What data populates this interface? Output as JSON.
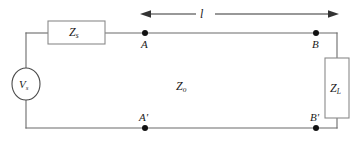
{
  "figure": {
    "type": "circuit-diagram",
    "colors": {
      "background": "#ffffff",
      "wire": "#6b6b6b",
      "component_outline": "#8a8a8a",
      "node_dot": "#111111",
      "arrow": "#333333",
      "text": "#1a1a1a"
    }
  },
  "source": {
    "symbol_name": "voltage-source",
    "label_base": "V",
    "label_sub": "s"
  },
  "source_impedance": {
    "symbol_name": "impedance-box",
    "label_base": "Z",
    "label_sub": "s"
  },
  "load_impedance": {
    "symbol_name": "impedance-box",
    "label_base": "Z",
    "label_sub": "L"
  },
  "line_impedance": {
    "label_base": "Z",
    "label_sub": "o"
  },
  "length": {
    "label": "l",
    "dimension_name": "length-dimension-arrow"
  },
  "nodes": {
    "top_left": "A",
    "top_right": "B",
    "bottom_left": "A'",
    "bottom_right": "B'"
  }
}
